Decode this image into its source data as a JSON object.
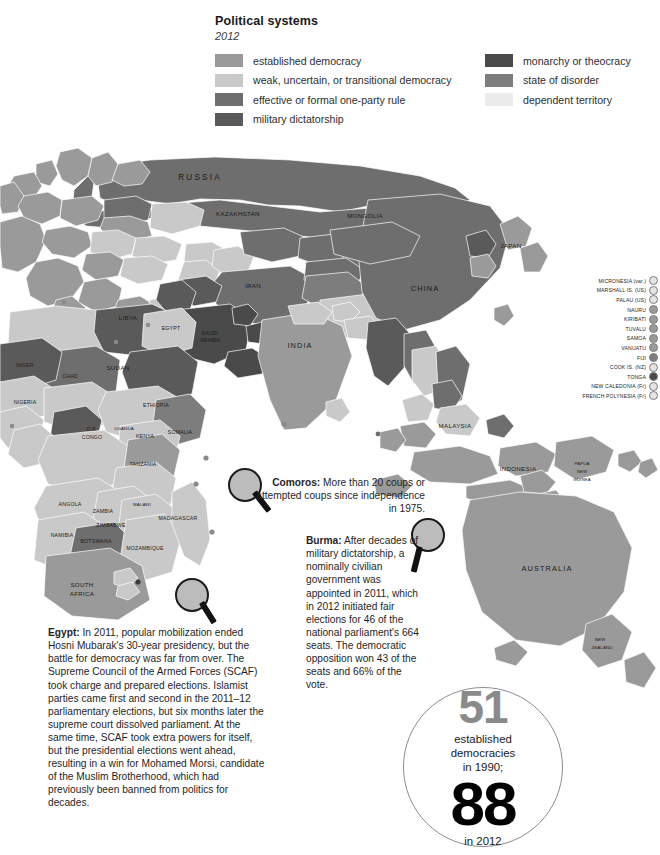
{
  "legend": {
    "title": "Political systems",
    "year": "2012",
    "left_items": [
      {
        "label": "established democracy",
        "color": "#9a9a9a"
      },
      {
        "label": "weak, uncertain, or transitional democracy",
        "color": "#c9c9c9"
      },
      {
        "label": "effective or formal one-party rule",
        "color": "#6e6e6e"
      },
      {
        "label": "military dictatorship",
        "color": "#5a5a5a"
      }
    ],
    "right_items": [
      {
        "label": "monarchy or theocracy",
        "color": "#4a4a4a"
      },
      {
        "label": "state of disorder",
        "color": "#7d7d7d"
      },
      {
        "label": "dependent territory",
        "color": "#ececec"
      }
    ]
  },
  "callouts": [
    {
      "id": "comoros",
      "title": "Comoros:",
      "body": " More than 20 coups or attempted coups since independence in 1975."
    },
    {
      "id": "burma",
      "title": "Burma:",
      "body": " After decades of military dictatorship, a nominally civilian government was appointed in 2011, which in 2012 initiated fair elections for 46 of the national parliament's 664 seats. The democratic opposition won 43 of the seats and 66% of the vote."
    },
    {
      "id": "egypt",
      "title": "Egypt:",
      "body": " In 2011, popular mobilization ended Hosni Mubarak's 30-year presidency, but the battle for democracy was far from over. The Supreme Council of the Armed Forces (SCAF) took charge and prepared elections. Islamist parties came first and second in the 2011–12 parliamentary elections, but six months later the supreme court dissolved parliament. At the same time, SCAF took extra powers for itself, but the presidential elections went ahead, resulting in a win for Mohamed Morsi, candidate of the Muslim Brotherhood, which had previously been banned from politics for decades."
    }
  ],
  "stat": {
    "count_1990": "51",
    "line1": "established",
    "line2": "democracies",
    "line3": "in 1990;",
    "count_2012": "88",
    "footer": "in 2012"
  },
  "chart_data": {
    "type": "map",
    "title": "Political systems",
    "subtitle": "2012",
    "legend_position": "top",
    "categories": [
      "established democracy",
      "weak, uncertain, or transitional democracy",
      "effective or formal one-party rule",
      "military dictatorship",
      "monarchy or theocracy",
      "state of disorder",
      "dependent territory"
    ],
    "category_colors": [
      "#9a9a9a",
      "#c9c9c9",
      "#6e6e6e",
      "#5a5a5a",
      "#4a4a4a",
      "#7d7d7d",
      "#ececec"
    ],
    "summary_values": [
      {
        "name": "established democracies in 1990",
        "value": 51
      },
      {
        "name": "established democracies in 2012",
        "value": 88
      }
    ],
    "annotations": [
      {
        "name": "Comoros",
        "text": "More than 20 coups or attempted coups since independence in 1975."
      },
      {
        "name": "Burma",
        "text": "After decades of military dictatorship, a nominally civilian government was appointed in 2011, which in 2012 initiated fair elections for 46 of the national parliament's 664 seats. The democratic opposition won 43 of the seats and 66% of the vote."
      },
      {
        "name": "Egypt",
        "text": "In 2011, popular mobilization ended Hosni Mubarak's 30-year presidency, but the battle for democracy was far from over."
      }
    ]
  },
  "islands": [
    {
      "name": "MICRONESIA (var.)",
      "color": "#e4e4e4"
    },
    {
      "name": "MARSHALL IS. (US)",
      "color": "#e4e4e4"
    },
    {
      "name": "PALAU (US)",
      "color": "#e4e4e4"
    },
    {
      "name": "NAURU",
      "color": "#9a9a9a"
    },
    {
      "name": "KIRIBATI",
      "color": "#9a9a9a"
    },
    {
      "name": "TUVALU",
      "color": "#9a9a9a"
    },
    {
      "name": "SAMOA",
      "color": "#9a9a9a"
    },
    {
      "name": "VANUATU",
      "color": "#9a9a9a"
    },
    {
      "name": "FIJI",
      "color": "#7d7d7d"
    },
    {
      "name": "COOK IS. (NZ)",
      "color": "#e4e4e4"
    },
    {
      "name": "TONGA",
      "color": "#4a4a4a"
    },
    {
      "name": "NEW CALEDONIA (Fr)",
      "color": "#e4e4e4"
    },
    {
      "name": "FRENCH POLYNESIA (Fr)",
      "color": "#e4e4e4"
    }
  ],
  "map_labels": [
    {
      "t": "RUSSIA",
      "x": 200,
      "y": 177,
      "s": "xl"
    },
    {
      "t": "KAZAKHSTAN",
      "x": 238,
      "y": 213,
      "s": "m"
    },
    {
      "t": "MONGOLIA",
      "x": 365,
      "y": 215,
      "s": "m"
    },
    {
      "t": "CHINA",
      "x": 425,
      "y": 288,
      "s": "l"
    },
    {
      "t": "INDIA",
      "x": 300,
      "y": 345,
      "s": "l"
    },
    {
      "t": "AUSTRALIA",
      "x": 547,
      "y": 568,
      "s": "l"
    },
    {
      "t": "INDONESIA",
      "x": 518,
      "y": 468,
      "s": "m"
    },
    {
      "t": "MALAYSIA",
      "x": 455,
      "y": 425,
      "s": "m"
    },
    {
      "t": "JAPAN",
      "x": 511,
      "y": 245,
      "s": "m"
    },
    {
      "t": "IRAN",
      "x": 253,
      "y": 285,
      "s": "m"
    },
    {
      "t": "SAUDI",
      "x": 210,
      "y": 333,
      "s": "s"
    },
    {
      "t": "ARABIA",
      "x": 210,
      "y": 340,
      "s": "s"
    },
    {
      "t": "EGYPT",
      "x": 171,
      "y": 328,
      "s": "s"
    },
    {
      "t": "LIBYA",
      "x": 128,
      "y": 317,
      "s": "m"
    },
    {
      "t": "SUDAN",
      "x": 118,
      "y": 367,
      "s": "m"
    },
    {
      "t": "CHAD",
      "x": 70,
      "y": 376,
      "s": "s"
    },
    {
      "t": "NIGER",
      "x": 25,
      "y": 365,
      "s": "s"
    },
    {
      "t": "NIGERIA",
      "x": 25,
      "y": 402,
      "s": "s"
    },
    {
      "t": "D.R.",
      "x": 92,
      "y": 429,
      "s": "s"
    },
    {
      "t": "CONGO",
      "x": 92,
      "y": 437,
      "s": "s"
    },
    {
      "t": "ETHIOPIA",
      "x": 156,
      "y": 405,
      "s": "s"
    },
    {
      "t": "SOMALIA",
      "x": 180,
      "y": 432,
      "s": "s"
    },
    {
      "t": "KENYA",
      "x": 145,
      "y": 436,
      "s": "s"
    },
    {
      "t": "UGANDA",
      "x": 124,
      "y": 428,
      "s": "xs"
    },
    {
      "t": "TANZANIA",
      "x": 143,
      "y": 464,
      "s": "s"
    },
    {
      "t": "ANGOLA",
      "x": 70,
      "y": 504,
      "s": "s"
    },
    {
      "t": "ZAMBIA",
      "x": 103,
      "y": 511,
      "s": "s"
    },
    {
      "t": "ZIMBABWE",
      "x": 111,
      "y": 525,
      "s": "s"
    },
    {
      "t": "BOTSWANA",
      "x": 96,
      "y": 541,
      "s": "s"
    },
    {
      "t": "NAMIBIA",
      "x": 62,
      "y": 535,
      "s": "s"
    },
    {
      "t": "SOUTH",
      "x": 82,
      "y": 584,
      "s": "m"
    },
    {
      "t": "AFRICA",
      "x": 82,
      "y": 593,
      "s": "m"
    },
    {
      "t": "MOZAMBIQUE",
      "x": 145,
      "y": 548,
      "s": "s"
    },
    {
      "t": "MADAGASCAR",
      "x": 178,
      "y": 518,
      "s": "s"
    },
    {
      "t": "MALAWI",
      "x": 142,
      "y": 504,
      "s": "xs"
    },
    {
      "t": "PAPUA",
      "x": 582,
      "y": 463,
      "s": "xs"
    },
    {
      "t": "NEW",
      "x": 582,
      "y": 471,
      "s": "xs"
    },
    {
      "t": "GUINEA",
      "x": 582,
      "y": 479,
      "s": "xs"
    },
    {
      "t": "NEW",
      "x": 600,
      "y": 639,
      "s": "xs"
    },
    {
      "t": "ZEALAND",
      "x": 602,
      "y": 647,
      "s": "xs"
    }
  ]
}
